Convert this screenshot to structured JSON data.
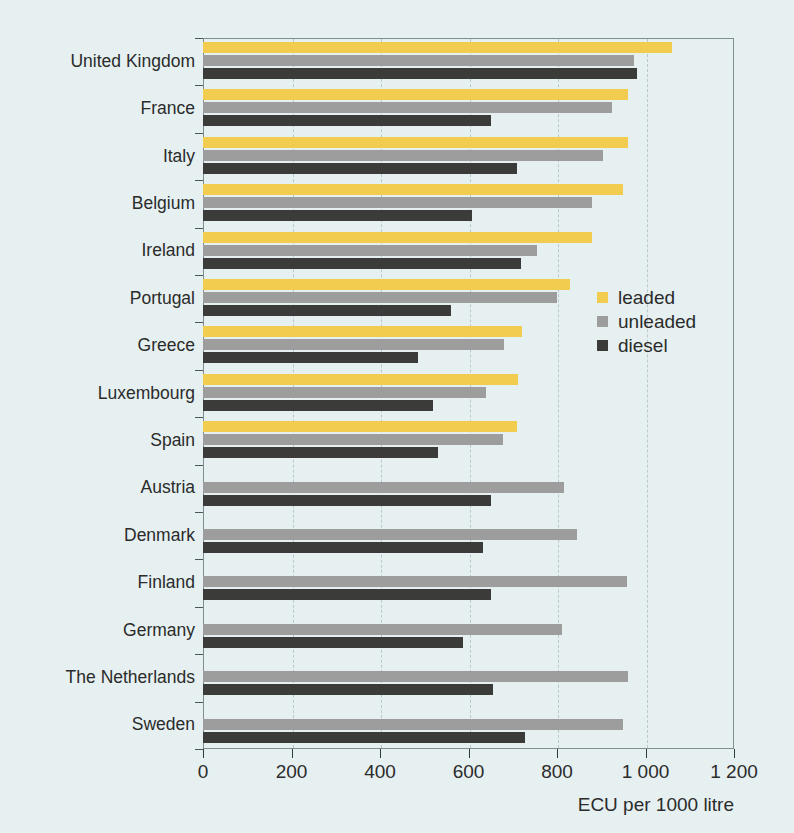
{
  "chart_data": {
    "type": "bar",
    "orientation": "horizontal",
    "title": "",
    "xlabel": "ECU per 1000 litre",
    "ylabel": "",
    "xlim": [
      0,
      1200
    ],
    "xticks": [
      0,
      200,
      400,
      600,
      800,
      1000,
      1200
    ],
    "xticklabels": [
      "0",
      "200",
      "400",
      "600",
      "800",
      "1 000",
      "1 200"
    ],
    "grid": true,
    "grid_axis": "x",
    "legend_position": "center-right",
    "categories": [
      "United Kingdom",
      "France",
      "Italy",
      "Belgium",
      "Ireland",
      "Portugal",
      "Greece",
      "Luxembourg",
      "Spain",
      "Austria",
      "Denmark",
      "Finland",
      "Germany",
      "The Netherlands",
      "Sweden"
    ],
    "series": [
      {
        "name": "leaded",
        "color": "#f2cc4e",
        "values": [
          1060,
          960,
          960,
          950,
          880,
          830,
          722,
          712,
          710,
          null,
          null,
          null,
          null,
          null,
          null
        ]
      },
      {
        "name": "unleaded",
        "color": "#9d9d9d",
        "values": [
          975,
          925,
          905,
          880,
          755,
          800,
          680,
          640,
          678,
          815,
          845,
          958,
          812,
          960,
          950
        ]
      },
      {
        "name": "diesel",
        "color": "#3b3b39",
        "values": [
          980,
          650,
          710,
          608,
          718,
          560,
          485,
          520,
          530,
          650,
          632,
          650,
          588,
          655,
          727
        ]
      }
    ]
  },
  "legend": {
    "items": [
      {
        "label": "leaded",
        "color": "#f2cc4e"
      },
      {
        "label": "unleaded",
        "color": "#9d9d9d"
      },
      {
        "label": "diesel",
        "color": "#3b3b39"
      }
    ]
  },
  "colors": {
    "background": "#e6f0f1",
    "frame": "#7e8f93",
    "grid": "#b9c8cb",
    "text": "#2b2b2b"
  }
}
